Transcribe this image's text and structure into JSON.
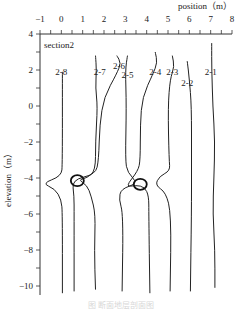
{
  "chart_data": {
    "type": "line",
    "title": "",
    "annotation": "section2",
    "xlabel": "position（m）",
    "ylabel": "elevation（m）",
    "xlim": [
      -1,
      8
    ],
    "ylim": [
      -10.5,
      4
    ],
    "x_ticks": [
      -1,
      0,
      1,
      2,
      3,
      4,
      5,
      6,
      7,
      8
    ],
    "y_ticks": [
      4,
      2,
      0,
      -2,
      -4,
      -6,
      -8,
      -10
    ],
    "x_axis_position": "top",
    "grid": false,
    "legend": "none",
    "series": [
      {
        "name": "2-8",
        "label_pos": [
          0.0,
          1.9
        ],
        "points": [
          [
            0.05,
            1.9
          ],
          [
            0.05,
            -3.2
          ],
          [
            0.0,
            -3.9
          ],
          [
            -0.9,
            -4.3
          ],
          [
            -0.3,
            -4.6
          ],
          [
            0.0,
            -5.2
          ],
          [
            0.05,
            -6
          ],
          [
            0.05,
            -10.4
          ]
        ]
      },
      {
        "name": "2-7",
        "label_pos": [
          1.8,
          1.9
        ],
        "points": [
          [
            1.6,
            2.8
          ],
          [
            1.65,
            2.0
          ],
          [
            1.6,
            1.0
          ],
          [
            1.7,
            0.0
          ],
          [
            1.6,
            -2
          ],
          [
            1.6,
            -3.6
          ],
          [
            1.2,
            -4.0
          ],
          [
            0.8,
            -4.1
          ],
          [
            1.2,
            -4.4
          ],
          [
            1.4,
            -5
          ],
          [
            1.6,
            -6
          ],
          [
            1.55,
            -8
          ],
          [
            1.6,
            -10.2
          ]
        ]
      },
      {
        "name": "2-6",
        "label_pos": [
          2.7,
          2.2
        ],
        "points": [
          [
            2.6,
            2.8
          ],
          [
            2.8,
            2.4
          ],
          [
            2.6,
            1.8
          ],
          [
            2.0,
            0.5
          ],
          [
            1.8,
            -1
          ],
          [
            1.75,
            -3
          ],
          [
            1.6,
            -3.8
          ],
          [
            0.5,
            -4.1
          ],
          [
            0.6,
            -5
          ],
          [
            0.6,
            -6
          ],
          [
            0.6,
            -10.3
          ]
        ]
      },
      {
        "name": "2-5",
        "label_pos": [
          3.1,
          1.7
        ],
        "points": [
          [
            3.1,
            2.8
          ],
          [
            3.0,
            2.0
          ],
          [
            3.05,
            0
          ],
          [
            3.0,
            -3
          ],
          [
            3.1,
            -3.7
          ],
          [
            3.6,
            -4.3
          ],
          [
            2.8,
            -4.6
          ],
          [
            2.7,
            -5.2
          ],
          [
            2.9,
            -6
          ],
          [
            2.85,
            -10.3
          ]
        ]
      },
      {
        "name": "2-4",
        "label_pos": [
          4.4,
          1.9
        ],
        "points": [
          [
            4.4,
            3.0
          ],
          [
            4.5,
            2.4
          ],
          [
            4.3,
            1.8
          ],
          [
            3.8,
            0.5
          ],
          [
            3.7,
            -1
          ],
          [
            3.7,
            -3
          ],
          [
            3.6,
            -3.6
          ],
          [
            3.0,
            -4.5
          ],
          [
            3.5,
            -4.4
          ],
          [
            3.9,
            -4.5
          ],
          [
            4.1,
            -5
          ],
          [
            4.1,
            -6
          ],
          [
            4.15,
            -10.4
          ]
        ]
      },
      {
        "name": "2-3",
        "label_pos": [
          5.2,
          1.9
        ],
        "points": [
          [
            5.2,
            2.8
          ],
          [
            5.3,
            2.2
          ],
          [
            5.1,
            1.5
          ],
          [
            5.0,
            0
          ],
          [
            5.05,
            -3
          ],
          [
            5.1,
            -3.6
          ],
          [
            4.6,
            -3.9
          ],
          [
            4.4,
            -4.4
          ],
          [
            4.9,
            -4.8
          ],
          [
            5.15,
            -6
          ],
          [
            5.1,
            -10.3
          ]
        ]
      },
      {
        "name": "2-2",
        "label_pos": [
          5.9,
          1.3
        ],
        "points": [
          [
            5.9,
            2.5
          ],
          [
            6.0,
            1.5
          ],
          [
            6.1,
            0
          ],
          [
            6.1,
            -3
          ],
          [
            6.1,
            -6
          ],
          [
            6.05,
            -10.3
          ]
        ]
      },
      {
        "name": "2-1",
        "label_pos": [
          7.0,
          1.9
        ],
        "points": [
          [
            7.05,
            3.5
          ],
          [
            7.05,
            2.0
          ],
          [
            7.1,
            0
          ],
          [
            7.2,
            -2
          ],
          [
            7.15,
            -4
          ],
          [
            7.1,
            -6
          ],
          [
            7.2,
            -8
          ],
          [
            7.2,
            -10.1
          ]
        ]
      }
    ],
    "markers": [
      {
        "shape": "circle",
        "x": 0.75,
        "y": -4.15
      },
      {
        "shape": "circle",
        "x": 3.7,
        "y": -4.35
      }
    ]
  },
  "caption": "图 断面地层剖面图"
}
